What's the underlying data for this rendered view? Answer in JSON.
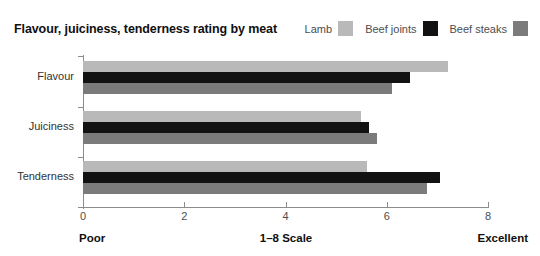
{
  "chart_data": {
    "type": "bar",
    "orientation": "horizontal",
    "title": "Flavour, juiciness, tenderness rating by meat",
    "xlabel": "1–8 Scale",
    "ylabel": "",
    "categories": [
      "Flavour",
      "Juiciness",
      "Tenderness"
    ],
    "series": [
      {
        "name": "Lamb",
        "color": "#b9b9b9",
        "values": [
          7.2,
          5.5,
          5.6
        ]
      },
      {
        "name": "Beef joints",
        "color": "#121212",
        "values": [
          6.45,
          5.65,
          7.05
        ]
      },
      {
        "name": "Beef steaks",
        "color": "#7b7b7b",
        "values": [
          6.1,
          5.8,
          6.8
        ]
      }
    ],
    "xlim": [
      0,
      8
    ],
    "xticks": [
      "0",
      "2",
      "4",
      "6",
      "8"
    ],
    "xtick_values": [
      0,
      2,
      4,
      6,
      8
    ],
    "grid": false,
    "legend_position": "top-right",
    "axis_endpoint_labels": {
      "low": "Poor",
      "middle": "1–8 Scale",
      "high": "Excellent"
    }
  }
}
